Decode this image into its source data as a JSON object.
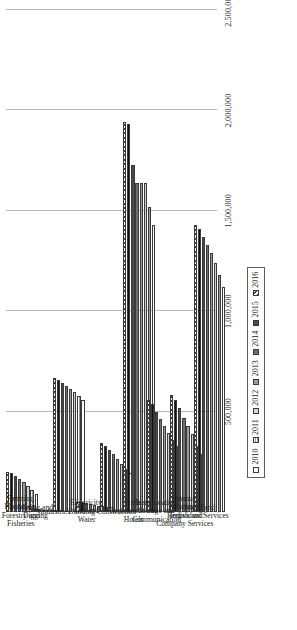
{
  "chart_data": {
    "type": "bar",
    "orientation": "horizontal",
    "title": "",
    "subtitle": "",
    "xlabel": "",
    "ylabel": "",
    "xlim": [
      0,
      2500000
    ],
    "grid": true,
    "legend_position": "bottom-right",
    "tick_labels": [
      "500,000",
      "1,000,000",
      "1,500,000",
      "2,000,000",
      "2,500,000"
    ],
    "tick_values": [
      500000,
      1000000,
      1500000,
      2000000,
      2500000
    ],
    "categories": [
      "Farming, Plantation, Forestry and Fisheries",
      "Mining and Digging",
      "Industries",
      "Electricity, Gas and Water",
      "Building Construction",
      "Trade, Restaurants and Hotels",
      "Transporation, Storage and Communication",
      "Finance, Insurance, Rentals and Company Services",
      "Social and Individual Services"
    ],
    "series": [
      {
        "name": "2010",
        "color": "#ffffff",
        "values": [
          90000,
          8000,
          560000,
          25000,
          195000,
          1430000,
          330000,
          290000,
          1120000
        ]
      },
      {
        "name": "2011",
        "color": "#ffffff",
        "values": [
          110000,
          9000,
          580000,
          28000,
          215000,
          1520000,
          360000,
          330000,
          1180000
        ]
      },
      {
        "name": "2012",
        "color": "#d2d2d2",
        "values": [
          130000,
          10000,
          600000,
          32000,
          240000,
          1640000,
          395000,
          390000,
          1240000
        ]
      },
      {
        "name": "2013",
        "color": "#9c9c9c",
        "values": [
          150000,
          11000,
          615000,
          36000,
          265000,
          1640000,
          430000,
          430000,
          1290000
        ]
      },
      {
        "name": "2014",
        "color": "#6f6f6f",
        "values": [
          165000,
          12000,
          625000,
          40000,
          290000,
          1640000,
          465000,
          470000,
          1330000
        ]
      },
      {
        "name": "2015",
        "color": "#4a4a4a",
        "values": [
          180000,
          13000,
          640000,
          44000,
          310000,
          1730000,
          500000,
          520000,
          1370000
        ]
      },
      {
        "name": "2016",
        "color": "#111111",
        "values": [
          195000,
          14000,
          655000,
          48000,
          330000,
          1930000,
          540000,
          560000,
          1410000
        ]
      },
      {
        "name": "2016 ",
        "color": "#hatched",
        "values": [
          200000,
          15000,
          665000,
          52000,
          345000,
          1940000,
          560000,
          585000,
          1430000
        ]
      }
    ],
    "legend_entries": [
      "2010",
      "2011",
      "2012",
      "2013",
      "2014",
      "2015",
      "2016"
    ]
  },
  "legend": {
    "items": [
      {
        "label": "2010"
      },
      {
        "label": "2011"
      },
      {
        "label": "2012"
      },
      {
        "label": "2013"
      },
      {
        "label": "2014"
      },
      {
        "label": "2015"
      },
      {
        "label": "2016"
      }
    ]
  }
}
